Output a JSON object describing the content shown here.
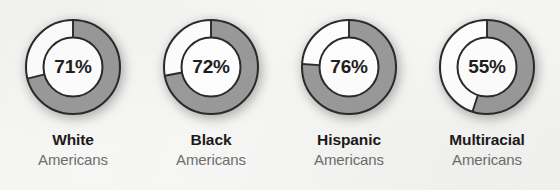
{
  "background_color": "#f7f7f5",
  "chart_data": {
    "type": "pie",
    "title": "",
    "subtitle": "",
    "xlabel": "",
    "ylabel": "",
    "variant": "donut-gauge-series",
    "units": "percent",
    "value_range": [
      0,
      100
    ],
    "start_angle_deg": 0,
    "direction": "clockwise",
    "grid": false,
    "legend_position": "none",
    "filled_color": "#9a9a9a",
    "remainder_color": "#ffffff",
    "stroke_color": "#2a2a2a",
    "categories": [
      "White Americans",
      "Black Americans",
      "Hispanic Americans",
      "Multiracial Americans"
    ],
    "values": [
      71,
      72,
      76,
      55
    ],
    "series": [
      {
        "name": "Share",
        "values": [
          71,
          72,
          76,
          55
        ]
      }
    ],
    "slices": [
      {
        "category": "White Americans",
        "filled": 71,
        "remainder": 29
      },
      {
        "category": "Black Americans",
        "filled": 72,
        "remainder": 28
      },
      {
        "category": "Hispanic Americans",
        "filled": 76,
        "remainder": 24
      },
      {
        "category": "Multiracial Americans",
        "filled": 55,
        "remainder": 45
      }
    ]
  },
  "donuts": [
    {
      "percent_label": "71%",
      "value": 71,
      "label_primary": "White",
      "label_secondary": "Americans"
    },
    {
      "percent_label": "72%",
      "value": 72,
      "label_primary": "Black",
      "label_secondary": "Americans"
    },
    {
      "percent_label": "76%",
      "value": 76,
      "label_primary": "Hispanic",
      "label_secondary": "Americans"
    },
    {
      "percent_label": "55%",
      "value": 55,
      "label_primary": "Multiracial",
      "label_secondary": "Americans"
    }
  ]
}
